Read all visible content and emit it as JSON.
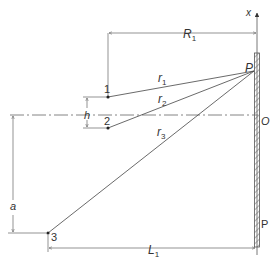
{
  "diagram": {
    "labels": {
      "x_axis": "x",
      "R": "R",
      "R_sub": "1",
      "P_top": "P",
      "O": "O",
      "P_bottom": "P",
      "r1": "r",
      "r1_sub": "1",
      "r2": "r",
      "r2_sub": "2",
      "r3": "r",
      "r3_sub": "3",
      "point1": "1",
      "point2": "2",
      "point3": "3",
      "h": "h",
      "a": "a",
      "L": "L",
      "L_sub": "1"
    },
    "colors": {
      "line": "#555555",
      "text": "#333333",
      "background": "#ffffff"
    }
  }
}
